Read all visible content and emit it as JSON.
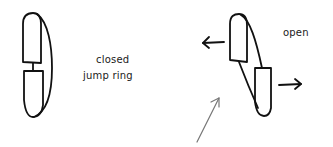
{
  "diagram": {
    "closed_ring": {
      "label_line1": "closed",
      "label_line2": "jump ring"
    },
    "open_ring": {
      "label": "open"
    },
    "colors": {
      "background": "#ffffff",
      "ink": "#111111",
      "pointer_arrow": "#777777"
    },
    "icons": {
      "left_arrow": "arrow-left-icon",
      "right_arrow": "arrow-right-icon",
      "pointer_arrow": "arrow-up-right-icon"
    }
  }
}
